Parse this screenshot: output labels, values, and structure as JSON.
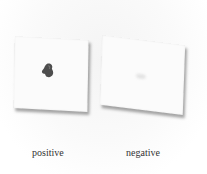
{
  "image": {
    "description": "Two white test cards photographed side by side; the left card shows a dark stain, the right card shows only a faint mark",
    "colors": {
      "background": "#ffffff",
      "card": "#fbfbfb",
      "stain": "#3a3a3a",
      "faint_mark": "#e4e4e4"
    }
  },
  "panels": [
    {
      "label": "positive",
      "result": "dark stain"
    },
    {
      "label": "negative",
      "result": "faint mark"
    }
  ]
}
